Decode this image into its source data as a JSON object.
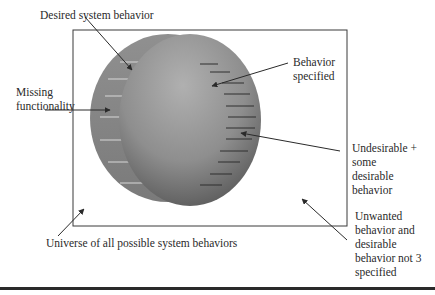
{
  "diagram": {
    "labels": {
      "desired": "Desired system behavior",
      "missing_1": "Missing",
      "missing_2": "functionality",
      "specified_1": "Behavior",
      "specified_2": "specified",
      "undesirable_1": "Undesirable +",
      "undesirable_2": "some",
      "undesirable_3": "desirable",
      "undesirable_4": "behavior",
      "unwanted_1": "Unwanted",
      "unwanted_2": "behavior and",
      "unwanted_3": "desirable",
      "unwanted_4": "behavior not 3",
      "unwanted_5": "specified",
      "universe": "Universe of all possible system behaviors"
    },
    "colors": {
      "desired_circle": "#8a8a8a",
      "specified_circle_light": "#a8a8a8",
      "specified_circle_dark": "#555555",
      "border": "#3a3a3a"
    }
  }
}
